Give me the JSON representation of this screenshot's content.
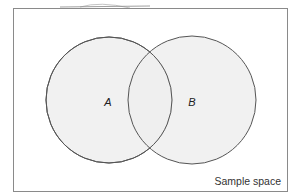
{
  "diagram": {
    "type": "venn",
    "sets": [
      {
        "name": "A",
        "cx": 109,
        "cy": 100,
        "r": 63
      },
      {
        "name": "B",
        "cx": 192,
        "cy": 100,
        "r": 64
      }
    ],
    "labels": {
      "a": "A",
      "b": "B"
    },
    "caption": "Sample space",
    "colors": {
      "fill": "#ededed",
      "stroke": "#555555",
      "frame": "#8a8a8a"
    }
  }
}
